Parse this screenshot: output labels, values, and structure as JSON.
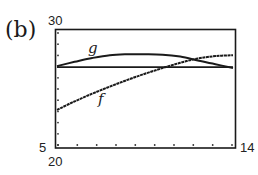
{
  "panel": {
    "label": "(b)"
  },
  "axes": {
    "y_max_label": "30",
    "y_min_label": "5",
    "x_min_label": "20",
    "x_max_label": "14"
  },
  "chart_data": {
    "type": "line",
    "title": "",
    "xlabel": "",
    "ylabel": "",
    "ylim": [
      5,
      30
    ],
    "window_labels": {
      "ymax": "30",
      "ymin": "5",
      "xmin": "20",
      "xmax": "14"
    },
    "grid": false,
    "tick_dots": {
      "x_count": 10,
      "y_count": 11
    },
    "x": [
      0,
      0.1,
      0.2,
      0.3,
      0.4,
      0.5,
      0.6,
      0.7,
      0.8,
      0.9,
      1.0
    ],
    "x_note": "normalized horizontal position across the viewing window (0 = left edge, 1 = right edge)",
    "series": [
      {
        "name": "g",
        "label": "g",
        "values": [
          22.2,
          23.1,
          23.9,
          24.5,
          24.7,
          24.7,
          24.6,
          24.2,
          23.4,
          22.6,
          21.8
        ]
      },
      {
        "name": "f",
        "label": "f",
        "values": [
          13.0,
          14.8,
          16.4,
          17.9,
          19.3,
          20.6,
          21.8,
          22.9,
          23.8,
          24.3,
          24.5
        ]
      },
      {
        "name": "horizontal line",
        "label": "",
        "values": [
          22.0,
          22.0,
          22.0,
          22.0,
          22.0,
          22.0,
          22.0,
          22.0,
          22.0,
          22.0,
          22.0
        ]
      }
    ],
    "annotations": [
      {
        "text": "g",
        "position": "upper-left, above curve g"
      },
      {
        "text": "f",
        "position": "below curve f, left-center"
      }
    ]
  }
}
